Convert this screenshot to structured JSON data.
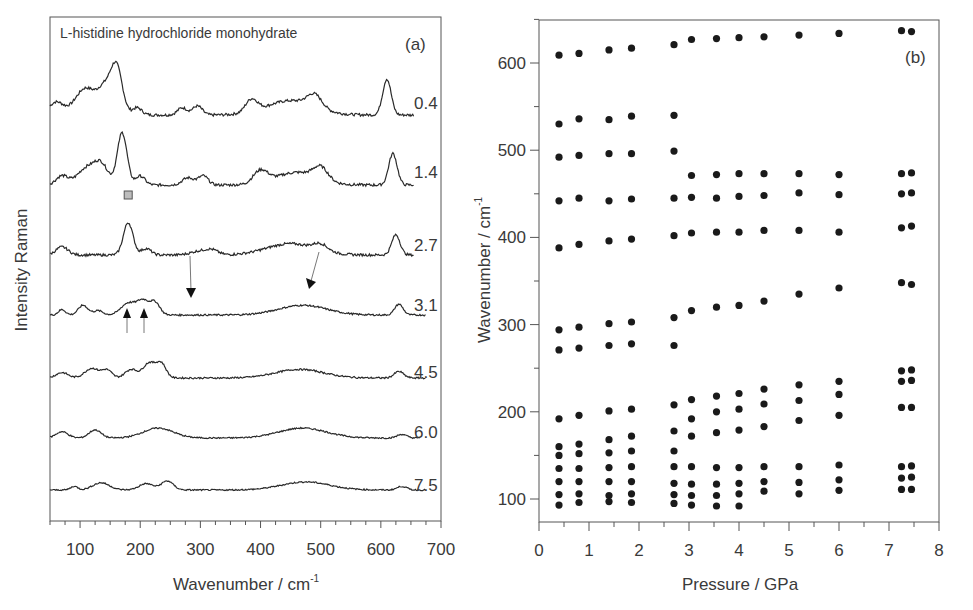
{
  "chart_data": [
    {
      "panel": "(a)",
      "type": "line",
      "title": "L-histidine hydrochloride monohydrate",
      "xlabel": "Wavenumber / cm",
      "xlabel_superscript": "-1",
      "ylabel": "Intensity Raman",
      "xlim": [
        50,
        700
      ],
      "xticks": [
        100,
        200,
        300,
        400,
        500,
        600,
        700
      ],
      "grid": false,
      "legend": "none; pressure labels at right end of each trace",
      "series_labels": [
        "0.4",
        "1.4",
        "2.7",
        "3.1",
        "4.5",
        "6.0",
        "7.5"
      ],
      "series": [
        {
          "name": "0.4",
          "peaks_cm-1": [
            60,
            110,
            160,
            195,
            270,
            295,
            385,
            450,
            490,
            610
          ]
        },
        {
          "name": "1.4",
          "peaks_cm-1": [
            110,
            135,
            170,
            200,
            280,
            305,
            400,
            460,
            500,
            620
          ]
        },
        {
          "name": "2.7",
          "peaks_cm-1": [
            70,
            180,
            210,
            300,
            320,
            450,
            500,
            625
          ]
        },
        {
          "name": "3.1",
          "peaks_cm-1": [
            70,
            105,
            180,
            205,
            225,
            470,
            630
          ]
        },
        {
          "name": "4.5",
          "peaks_cm-1": [
            75,
            125,
            150,
            185,
            215,
            230,
            465,
            630
          ]
        },
        {
          "name": "6.0",
          "peaks_cm-1": [
            80,
            125,
            230,
            470,
            635
          ]
        },
        {
          "name": "7.5",
          "peaks_cm-1": [
            90,
            135,
            210,
            245,
            475,
            635
          ]
        }
      ],
      "annotations": [
        {
          "type": "square-marker",
          "x": 180,
          "trace": "2.7",
          "color": "#b0b0b0"
        },
        {
          "type": "arrow-down",
          "x": 290,
          "trace": "3.1"
        },
        {
          "type": "arrow-down",
          "x": 480,
          "trace": "3.1"
        },
        {
          "type": "arrow-up",
          "x": 178,
          "trace": "3.1"
        },
        {
          "type": "arrow-up",
          "x": 207,
          "trace": "3.1"
        }
      ]
    },
    {
      "panel": "(b)",
      "type": "scatter",
      "title": "",
      "xlabel": "Pressure / GPa",
      "ylabel": "Wavenumber / cm",
      "ylabel_superscript": "-1",
      "xlim": [
        0,
        8
      ],
      "ylim": [
        75,
        650
      ],
      "xticks": [
        0,
        1,
        2,
        3,
        4,
        5,
        6,
        7,
        8
      ],
      "yticks": [
        100,
        200,
        300,
        400,
        500,
        600
      ],
      "grid": false,
      "legend": "none",
      "marker_color": "#1a1a1a",
      "points": [
        {
          "p": 0.4,
          "w": [
            609,
            530,
            492,
            442,
            388,
            294,
            271,
            192,
            160,
            150,
            135,
            120,
            105,
            93
          ]
        },
        {
          "p": 0.8,
          "w": [
            611,
            536,
            494,
            445,
            392,
            297,
            273,
            196,
            163,
            152,
            135,
            120,
            106,
            96
          ]
        },
        {
          "p": 1.4,
          "w": [
            615,
            535,
            496,
            442,
            396,
            301,
            276,
            201,
            168,
            153,
            136,
            120,
            104,
            97
          ]
        },
        {
          "p": 1.85,
          "w": [
            617,
            539,
            496,
            444,
            398,
            303,
            278,
            203,
            172,
            155,
            137,
            120,
            106,
            96
          ]
        },
        {
          "p": 2.7,
          "w": [
            621,
            540,
            499,
            445,
            402,
            308,
            276,
            208,
            178,
            155,
            137,
            118,
            105,
            95
          ]
        },
        {
          "p": 3.05,
          "w": [
            627,
            471,
            446,
            405,
            316,
            214,
            192,
            172,
            137,
            117,
            104,
            93
          ]
        },
        {
          "p": 3.55,
          "w": [
            628,
            472,
            445,
            406,
            320,
            218,
            200,
            176,
            136,
            117,
            104,
            92
          ]
        },
        {
          "p": 4.0,
          "w": [
            629,
            473,
            447,
            406,
            322,
            221,
            203,
            179,
            136,
            118,
            106,
            92
          ]
        },
        {
          "p": 4.5,
          "w": [
            630,
            473,
            448,
            408,
            327,
            226,
            209,
            183,
            137,
            120,
            109
          ]
        },
        {
          "p": 5.2,
          "w": [
            632,
            473,
            451,
            408,
            335,
            231,
            213,
            190,
            137,
            119,
            106
          ]
        },
        {
          "p": 6.0,
          "w": [
            634,
            472,
            449,
            406,
            342,
            235,
            220,
            196,
            139,
            122,
            110
          ]
        },
        {
          "p": 7.25,
          "w": [
            637,
            473,
            450,
            411,
            348,
            247,
            235,
            205,
            137,
            124,
            111
          ]
        },
        {
          "p": 7.45,
          "w": [
            636,
            474,
            451,
            413,
            346,
            248,
            236,
            205,
            138,
            125,
            111
          ]
        }
      ]
    }
  ],
  "panel_a": {
    "title": "L-histidine hydrochloride monohydrate",
    "label": "(a)",
    "xlabel": "Wavenumber / cm",
    "xlabel_sup": "-1",
    "ylabel": "Intensity Raman",
    "xticks": [
      "100",
      "200",
      "300",
      "400",
      "500",
      "600",
      "700"
    ],
    "pressures": [
      "0.4",
      "1.4",
      "2.7",
      "3.1",
      "4.5",
      "6.0",
      "7.5"
    ]
  },
  "panel_b": {
    "label": "(b)",
    "xlabel": "Pressure / GPa",
    "ylabel": "Wavenumber / cm",
    "ylabel_sup": "-1",
    "xticks": [
      "0",
      "1",
      "2",
      "3",
      "4",
      "5",
      "6",
      "7",
      "8"
    ],
    "yticks": [
      "100",
      "200",
      "300",
      "400",
      "500",
      "600"
    ]
  }
}
